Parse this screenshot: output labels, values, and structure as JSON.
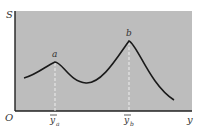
{
  "diagram": {
    "y_axis_label": "S",
    "x_axis_label": "y",
    "origin_label": "O",
    "peaks": [
      {
        "label": "a",
        "tick_label": "y",
        "tick_subscript": "a"
      },
      {
        "label": "b",
        "tick_label": "y",
        "tick_subscript": "b"
      }
    ],
    "colors": {
      "background": "#bdbdbd",
      "curve": "#1a1a1a",
      "axis": "#222222",
      "guide": "#eeeeee"
    }
  }
}
